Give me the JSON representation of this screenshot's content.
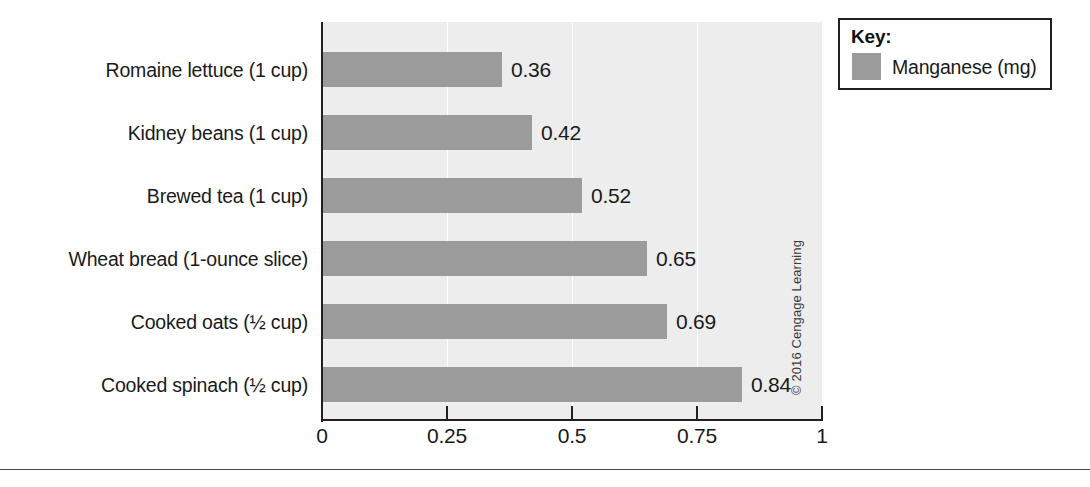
{
  "figure": {
    "credit": "© 2016 Cengage Learning",
    "plot_bg_color": "#ededed",
    "bar_color": "#9b9b9b",
    "axis_color": "#231f20"
  },
  "legend": {
    "title": "Key:",
    "entries": [
      {
        "label": "Manganese (mg)",
        "color": "#9b9b9b"
      }
    ]
  },
  "chart_data": {
    "type": "bar",
    "orientation": "horizontal",
    "title": "",
    "subtitle": "",
    "xlabel": "",
    "ylabel": "",
    "xlim": [
      0,
      1
    ],
    "grid": true,
    "legend_position": "top-right",
    "xticks": [
      "0",
      "0.25",
      "0.5",
      "0.75",
      "1"
    ],
    "xtick_values": [
      0,
      0.25,
      0.5,
      0.75,
      1
    ],
    "categories": [
      "Romaine lettuce (1 cup)",
      "Kidney beans (1 cup)",
      "Brewed tea (1 cup)",
      "Wheat bread (1-ounce slice)",
      "Cooked oats (½ cup)",
      "Cooked spinach (½ cup)"
    ],
    "values": [
      0.36,
      0.42,
      0.52,
      0.65,
      0.69,
      0.84
    ],
    "value_labels": [
      "0.36",
      "0.42",
      "0.52",
      "0.65",
      "0.69",
      "0.84"
    ],
    "series": [
      {
        "name": "Manganese (mg)",
        "values": [
          0.36,
          0.42,
          0.52,
          0.65,
          0.69,
          0.84
        ]
      }
    ]
  }
}
